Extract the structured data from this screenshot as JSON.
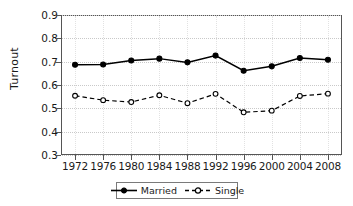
{
  "chart_data": {
    "type": "line",
    "title": "",
    "xlabel": "",
    "ylabel": "Turnout",
    "categories": [
      "1972",
      "1976",
      "1980",
      "1984",
      "1988",
      "1992",
      "1996",
      "2000",
      "2004",
      "2008"
    ],
    "x": [
      1972,
      1976,
      1980,
      1984,
      1988,
      1992,
      1996,
      2000,
      2004,
      2008
    ],
    "ylim": [
      0.3,
      0.9
    ],
    "yticks": [
      0.3,
      0.4,
      0.5,
      0.6,
      0.7,
      0.8,
      0.9
    ],
    "ytick_labels": [
      "0.3",
      "0.4",
      "0.5",
      "0.6",
      "0.7",
      "0.8",
      "0.9"
    ],
    "grid": true,
    "legend_position": "bottom-center",
    "series": [
      {
        "name": "Married",
        "line_style": "solid",
        "marker": "filled-circle",
        "color": "#000000",
        "values": [
          0.687,
          0.688,
          0.705,
          0.713,
          0.697,
          0.726,
          0.661,
          0.68,
          0.716,
          0.708
        ]
      },
      {
        "name": "Single",
        "line_style": "dashed",
        "marker": "open-circle",
        "color": "#000000",
        "values": [
          0.554,
          0.535,
          0.527,
          0.556,
          0.522,
          0.562,
          0.483,
          0.49,
          0.553,
          0.563
        ]
      }
    ]
  },
  "legend": {
    "entries": [
      {
        "label": "Married"
      },
      {
        "label": "Single"
      }
    ]
  },
  "axis": {
    "y_title": "Turnout"
  }
}
